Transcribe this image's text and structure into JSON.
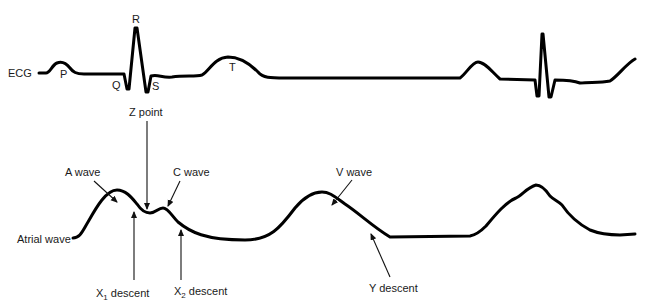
{
  "colors": {
    "line": "#000000",
    "text": "#1a1a1a",
    "background": "#ffffff"
  },
  "ecg": {
    "label": "ECG",
    "peaks": {
      "p": "P",
      "q": "Q",
      "r": "R",
      "s": "S",
      "t": "T"
    }
  },
  "atrial": {
    "label": "Atrial wave",
    "annotations": {
      "z_point": "Z point",
      "a_wave": "A wave",
      "c_wave": "C wave",
      "v_wave": "V wave",
      "x1_main": "X",
      "x1_sub": "1",
      "x1_rest": " descent",
      "x2_main": "X",
      "x2_sub": "2",
      "x2_rest": " descent",
      "y_descent": "Y descent"
    }
  }
}
